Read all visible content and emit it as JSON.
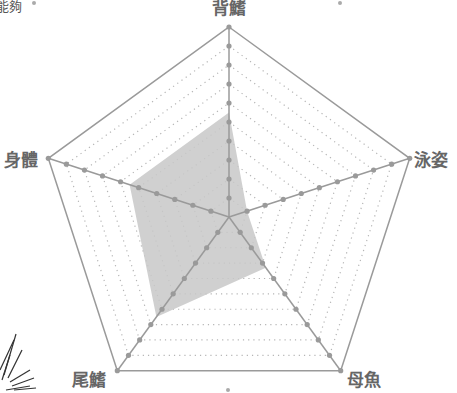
{
  "corner_text": "能夠",
  "chart_data": {
    "type": "radar",
    "title": "",
    "axes": [
      "背鰭",
      "泳姿",
      "母魚",
      "尾鰭",
      "身體"
    ],
    "max": 10,
    "levels": 10,
    "grid": true,
    "series": [
      {
        "name": "評分",
        "values": [
          5.5,
          1,
          3.3,
          6.5,
          5.5
        ]
      }
    ],
    "colors": {
      "axis": "#9a9a9a",
      "grid_dots": "#b5b5b5",
      "fill": "#c8c8c8",
      "label": "#666666"
    }
  }
}
